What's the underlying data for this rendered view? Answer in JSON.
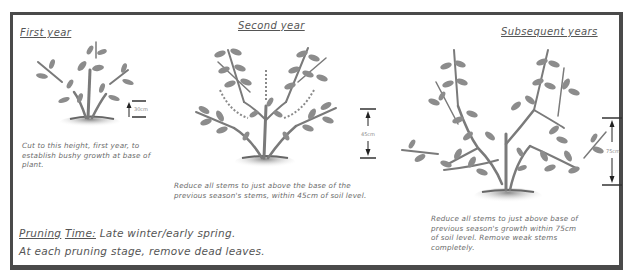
{
  "diagram": {
    "type": "pruning-stages-illustration",
    "stages": [
      {
        "title": "First year",
        "measurement": "30cm",
        "caption": "Cut to this height, first year, to establish bushy growth at base of plant."
      },
      {
        "title": "Second year",
        "measurement": "45cm",
        "caption": "Reduce all stems to just above the base of the previous season's stems, within 45cm of soil level."
      },
      {
        "title": "Subsequent years",
        "measurement": "75cm",
        "caption": "Reduce all stems to just above base of previous season's growth within 75cm of soil level. Remove weak stems completely."
      }
    ],
    "notes": {
      "pruning_label": "Pruning",
      "time_label": "Time:",
      "time_value": "Late winter/early spring.",
      "stage_note": "At each pruning stage, remove dead leaves."
    },
    "colors": {
      "frame": "#4a4a4a",
      "stem": "#7a7a7a",
      "leaf": "#8c8c8c",
      "soil": "#9a9a9a",
      "text": "#555555"
    }
  }
}
